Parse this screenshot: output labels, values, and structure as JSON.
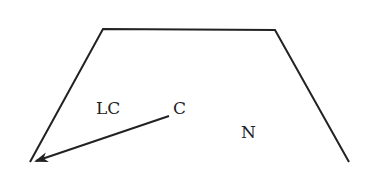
{
  "diagram": {
    "type": "trapezoid-with-arrow",
    "stroke_color": "#222222",
    "shape": {
      "name": "trapezoid",
      "points": [
        [
          30,
          162
        ],
        [
          103,
          29
        ],
        [
          275,
          30
        ],
        [
          349,
          162
        ]
      ]
    },
    "arrow": {
      "from": [
        169,
        116
      ],
      "to": [
        36,
        161
      ]
    },
    "labels": [
      {
        "id": "lc",
        "text": "LC",
        "x": 96,
        "y": 100
      },
      {
        "id": "c",
        "text": "C",
        "x": 173,
        "y": 100
      },
      {
        "id": "n",
        "text": "N",
        "x": 241,
        "y": 124
      }
    ]
  }
}
